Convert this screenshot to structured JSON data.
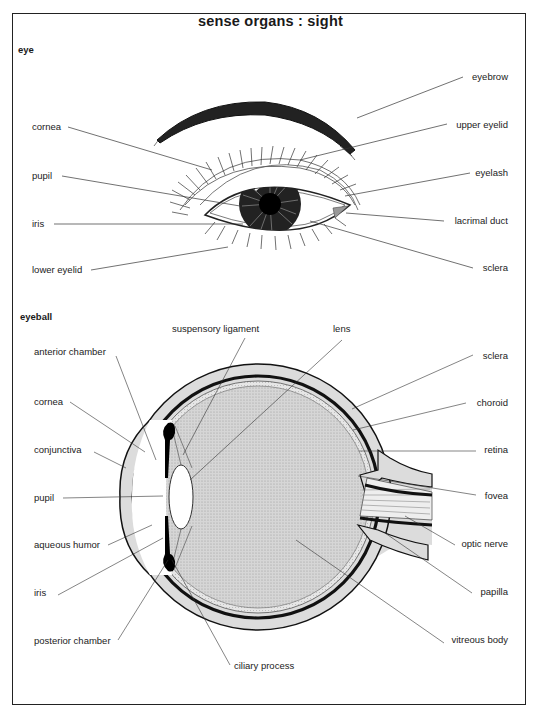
{
  "title": "sense organs : sight",
  "sections": {
    "eye": {
      "heading": "eye",
      "labels_left": [
        "cornea",
        "pupil",
        "iris",
        "lower eyelid"
      ],
      "labels_right": [
        "eyebrow",
        "upper eyelid",
        "eyelash",
        "lacrimal duct",
        "sclera"
      ]
    },
    "eyeball": {
      "heading": "eyeball",
      "labels_top": [
        "suspensory ligament",
        "lens"
      ],
      "labels_left": [
        "anterior chamber",
        "cornea",
        "conjunctiva",
        "pupil",
        "aqueous humor",
        "iris",
        "posterior chamber"
      ],
      "labels_right": [
        "sclera",
        "choroid",
        "retina",
        "fovea",
        "optic nerve",
        "papilla",
        "vitreous body"
      ],
      "labels_bottom": [
        "ciliary process"
      ]
    }
  },
  "colors": {
    "ink": "#1a1a1a",
    "tissue_fill": "#dcdcdc",
    "vitreous_fill": "#c8c8c8",
    "paper": "#ffffff"
  }
}
